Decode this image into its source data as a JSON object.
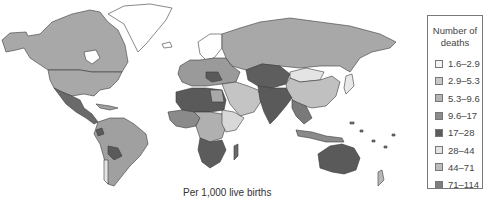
{
  "legend": {
    "title_line1": "Number of",
    "title_line2": "deaths",
    "items": [
      {
        "label": "1.6–2.9",
        "color": "#f4f4f4"
      },
      {
        "label": "2.9–5.3",
        "color": "#c8c8c8"
      },
      {
        "label": "5.3–9.6",
        "color": "#b4b4b4"
      },
      {
        "label": "9.6–17",
        "color": "#8c8c8c"
      },
      {
        "label": "17–28",
        "color": "#5c5c5c"
      },
      {
        "label": "28–44",
        "color": "#e4e4e4"
      },
      {
        "label": "44–71",
        "color": "#bdbdbd"
      },
      {
        "label": "71–114",
        "color": "#7e7e7e"
      }
    ]
  },
  "caption": "Per 1,000 live births",
  "map": {
    "description": "World choropleth map of infant deaths per 1,000 live births",
    "regions": [
      {
        "name": "canada-alaska",
        "shade": "#a8a8a8"
      },
      {
        "name": "usa",
        "shade": "#a8a8a8"
      },
      {
        "name": "greenland",
        "shade": "#ffffff"
      },
      {
        "name": "mexico-central-america",
        "shade": "#6a6a6a"
      },
      {
        "name": "south-america",
        "shade": "#a0a0a0"
      },
      {
        "name": "bolivia",
        "shade": "#5a5a5a"
      },
      {
        "name": "europe",
        "shade": "#9a9a9a"
      },
      {
        "name": "scandinavia",
        "shade": "#ffffff"
      },
      {
        "name": "russia",
        "shade": "#a8a8a8"
      },
      {
        "name": "central-asia",
        "shade": "#5e5e5e"
      },
      {
        "name": "china",
        "shade": "#c0c0c0"
      },
      {
        "name": "mongolia",
        "shade": "#e4e4e4"
      },
      {
        "name": "middle-east",
        "shade": "#c4c4c4"
      },
      {
        "name": "south-asia",
        "shade": "#5a5a5a"
      },
      {
        "name": "southeast-asia",
        "shade": "#7a7a7a"
      },
      {
        "name": "north-africa",
        "shade": "#5a5a5a"
      },
      {
        "name": "west-africa",
        "shade": "#8a8a8a"
      },
      {
        "name": "central-africa",
        "shade": "#b0b0b0"
      },
      {
        "name": "east-africa",
        "shade": "#d8d8d8"
      },
      {
        "name": "southern-africa",
        "shade": "#5c5c5c"
      },
      {
        "name": "madagascar",
        "shade": "#6a6a6a"
      },
      {
        "name": "australia",
        "shade": "#5a5a5a"
      },
      {
        "name": "japan",
        "shade": "#e8e8e8"
      },
      {
        "name": "new-zealand",
        "shade": "#b8b8b8"
      }
    ]
  }
}
